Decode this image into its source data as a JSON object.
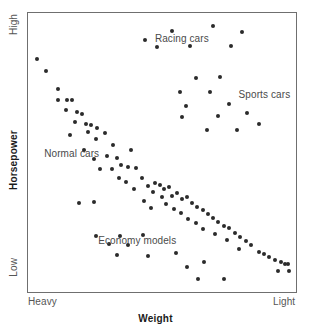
{
  "chart_data": {
    "type": "scatter",
    "title": "",
    "xlabel": "Weight",
    "ylabel": "Horsepower",
    "xlim": [
      0,
      100
    ],
    "ylim": [
      0,
      100
    ],
    "grid": false,
    "legend_position": "none",
    "x_tick_labels": [
      "Heavy",
      "Light"
    ],
    "y_tick_labels": [
      "Low",
      "High"
    ],
    "annotations": [
      {
        "id": "racing",
        "text": "Racing cars",
        "x": 47,
        "y": 93
      },
      {
        "id": "sports",
        "text": "Sports cars",
        "x": 78,
        "y": 73
      },
      {
        "id": "normal",
        "text": "Normal cars",
        "x": 6,
        "y": 52
      },
      {
        "id": "economy",
        "text": "Economy models",
        "x": 26,
        "y": 21
      }
    ],
    "series": [
      {
        "name": "Normal cars",
        "color": "#2b2b2b",
        "points": [
          [
            3.3,
            83.5
          ],
          [
            6.7,
            79.4
          ],
          [
            11.1,
            73.0
          ],
          [
            11.1,
            69.1
          ],
          [
            14.4,
            69.1
          ],
          [
            16.3,
            69.1
          ],
          [
            14.1,
            65.5
          ],
          [
            18.1,
            64.8
          ],
          [
            20.0,
            64.1
          ],
          [
            17.4,
            61.2
          ],
          [
            21.5,
            60.5
          ],
          [
            23.3,
            60.2
          ],
          [
            22.2,
            57.7
          ],
          [
            25.6,
            59.1
          ],
          [
            15.6,
            56.6
          ],
          [
            25.2,
            55.2
          ],
          [
            28.5,
            57.3
          ],
          [
            20.7,
            51.2
          ],
          [
            31.5,
            53.0
          ],
          [
            24.4,
            48.0
          ],
          [
            29.3,
            49.1
          ],
          [
            33.0,
            48.4
          ],
          [
            38.1,
            51.2
          ],
          [
            26.7,
            44.5
          ],
          [
            31.1,
            44.5
          ],
          [
            34.4,
            45.9
          ],
          [
            37.0,
            45.2
          ],
          [
            40.0,
            44.8
          ],
          [
            33.7,
            41.3
          ],
          [
            36.3,
            39.9
          ],
          [
            42.2,
            41.3
          ],
          [
            39.3,
            37.4
          ],
          [
            44.4,
            38.4
          ],
          [
            47.0,
            39.5
          ],
          [
            48.9,
            38.8
          ],
          [
            46.3,
            36.3
          ],
          [
            50.4,
            37.4
          ],
          [
            52.2,
            38.1
          ],
          [
            49.6,
            34.5
          ],
          [
            53.3,
            34.9
          ],
          [
            55.2,
            36.0
          ],
          [
            51.1,
            32.0
          ],
          [
            57.0,
            33.8
          ],
          [
            58.9,
            34.5
          ],
          [
            43.0,
            33.1
          ],
          [
            45.6,
            30.6
          ],
          [
            54.1,
            30.2
          ],
          [
            60.7,
            32.4
          ],
          [
            62.6,
            31.0
          ],
          [
            56.7,
            28.8
          ],
          [
            64.8,
            29.8
          ],
          [
            59.3,
            26.7
          ],
          [
            66.7,
            28.4
          ],
          [
            68.5,
            27.0
          ],
          [
            62.2,
            25.3
          ],
          [
            70.4,
            25.6
          ],
          [
            64.8,
            23.1
          ],
          [
            72.6,
            24.2
          ],
          [
            74.4,
            23.5
          ],
          [
            69.3,
            21.4
          ],
          [
            76.7,
            21.7
          ],
          [
            78.5,
            20.3
          ],
          [
            73.7,
            19.2
          ],
          [
            80.7,
            18.8
          ],
          [
            82.6,
            17.4
          ],
          [
            78.1,
            16.0
          ],
          [
            85.6,
            15.0
          ],
          [
            87.4,
            14.2
          ],
          [
            89.3,
            13.2
          ],
          [
            91.5,
            12.1
          ],
          [
            93.7,
            11.4
          ],
          [
            95.2,
            10.7
          ],
          [
            96.3,
            10.7
          ],
          [
            92.6,
            8.2
          ],
          [
            96.7,
            8.2
          ]
        ]
      },
      {
        "name": "Racing cars",
        "color": "#2b2b2b",
        "points": [
          [
            43.3,
            90.4
          ],
          [
            53.3,
            93.6
          ],
          [
            68.5,
            95.4
          ],
          [
            79.3,
            93.2
          ],
          [
            47.8,
            87.9
          ],
          [
            60.0,
            88.3
          ],
          [
            75.2,
            88.3
          ]
        ]
      },
      {
        "name": "Sports cars",
        "color": "#2b2b2b",
        "points": [
          [
            62.2,
            76.9
          ],
          [
            71.1,
            77.3
          ],
          [
            56.3,
            71.9
          ],
          [
            67.4,
            71.9
          ],
          [
            58.5,
            66.9
          ],
          [
            74.4,
            67.6
          ],
          [
            57.0,
            62.9
          ],
          [
            70.4,
            63.2
          ],
          [
            81.1,
            64.3
          ],
          [
            66.3,
            58.4
          ],
          [
            77.4,
            58.4
          ],
          [
            85.6,
            60.5
          ]
        ]
      },
      {
        "name": "Economy models",
        "color": "#2b2b2b",
        "points": [
          [
            18.9,
            32.4
          ],
          [
            24.4,
            32.8
          ],
          [
            25.2,
            20.6
          ],
          [
            34.1,
            20.6
          ],
          [
            42.6,
            21.0
          ],
          [
            30.0,
            17.8
          ],
          [
            37.0,
            17.4
          ],
          [
            33.0,
            13.9
          ],
          [
            44.4,
            13.5
          ],
          [
            54.8,
            14.6
          ],
          [
            58.9,
            9.6
          ],
          [
            65.2,
            11.4
          ],
          [
            63.0,
            5.3
          ],
          [
            72.6,
            5.3
          ]
        ]
      }
    ]
  },
  "labels": {
    "y_high": "High",
    "y_low": "Low",
    "x_heavy": "Heavy",
    "x_light": "Light",
    "y_title": "Horsepower",
    "x_title": "Weight",
    "ann_racing": "Racing cars",
    "ann_sports": "Sports cars",
    "ann_normal": "Normal cars",
    "ann_economy": "Economy models"
  }
}
